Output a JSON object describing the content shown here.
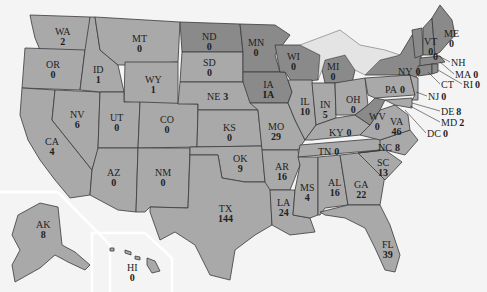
{
  "map": {
    "type": "us-states-choropleth",
    "fill_colors": {
      "default": "#a9a9a9",
      "highlight": "#8a8a8a",
      "water": "#f4f4f4"
    },
    "states": {
      "WA": {
        "abbr": "WA",
        "value": "2"
      },
      "OR": {
        "abbr": "OR",
        "value": "0"
      },
      "CA": {
        "abbr": "CA",
        "value": "4"
      },
      "NV": {
        "abbr": "NV",
        "value": "6"
      },
      "ID": {
        "abbr": "ID",
        "value": "1"
      },
      "MT": {
        "abbr": "MT",
        "value": "0"
      },
      "WY": {
        "abbr": "WY",
        "value": "1"
      },
      "UT": {
        "abbr": "UT",
        "value": "0"
      },
      "AZ": {
        "abbr": "AZ",
        "value": "0"
      },
      "CO": {
        "abbr": "CO",
        "value": "0"
      },
      "NM": {
        "abbr": "NM",
        "value": "0"
      },
      "ND": {
        "abbr": "ND",
        "value": "0"
      },
      "SD": {
        "abbr": "SD",
        "value": "0"
      },
      "NE": {
        "abbr": "NE",
        "value": "3"
      },
      "KS": {
        "abbr": "KS",
        "value": "0"
      },
      "OK": {
        "abbr": "OK",
        "value": "9"
      },
      "TX": {
        "abbr": "TX",
        "value": "144"
      },
      "MN": {
        "abbr": "MN",
        "value": "0"
      },
      "IA": {
        "abbr": "IA",
        "value": "IA"
      },
      "MO": {
        "abbr": "MO",
        "value": "29"
      },
      "AR": {
        "abbr": "AR",
        "value": "16"
      },
      "LA": {
        "abbr": "LA",
        "value": "24"
      },
      "WI": {
        "abbr": "WI",
        "value": "0"
      },
      "IL": {
        "abbr": "IL",
        "value": "10"
      },
      "MI": {
        "abbr": "MI",
        "value": "0"
      },
      "IN": {
        "abbr": "IN",
        "value": "5"
      },
      "OH": {
        "abbr": "OH",
        "value": "0"
      },
      "KY": {
        "abbr": "KY",
        "value": "0"
      },
      "TN": {
        "abbr": "TN",
        "value": "0"
      },
      "MS": {
        "abbr": "MS",
        "value": "4"
      },
      "AL": {
        "abbr": "AL",
        "value": "16"
      },
      "GA": {
        "abbr": "GA",
        "value": "22"
      },
      "FL": {
        "abbr": "FL",
        "value": "39"
      },
      "SC": {
        "abbr": "SC",
        "value": "13"
      },
      "NC": {
        "abbr": "NC",
        "value": "8"
      },
      "VA": {
        "abbr": "VA",
        "value": "46"
      },
      "WV": {
        "abbr": "WV",
        "value": "0"
      },
      "PA": {
        "abbr": "PA",
        "value": "0"
      },
      "NY": {
        "abbr": "NY",
        "value": "0"
      },
      "VT": {
        "abbr": "VT",
        "value": "0"
      },
      "NH": {
        "abbr": "NH",
        "value": "0"
      },
      "ME": {
        "abbr": "ME",
        "value": "0"
      },
      "MA": {
        "abbr": "MA",
        "value": "0"
      },
      "RI": {
        "abbr": "RI",
        "value": "0"
      },
      "CT": {
        "abbr": "CT",
        "value": "0"
      },
      "NJ": {
        "abbr": "NJ",
        "value": "0"
      },
      "DE": {
        "abbr": "DE",
        "value": "8"
      },
      "MD": {
        "abbr": "MD",
        "value": "2"
      },
      "DC": {
        "abbr": "DC",
        "value": "0"
      },
      "AK": {
        "abbr": "AK",
        "value": "8"
      },
      "HI": {
        "abbr": "HI",
        "value": "0"
      }
    }
  }
}
